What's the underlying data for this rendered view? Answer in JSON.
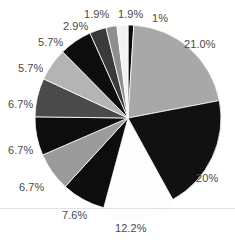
{
  "chart_data": {
    "type": "pie",
    "title": "",
    "xlabel": "",
    "ylabel": "",
    "legend": "none",
    "grid": false,
    "center": {
      "x": 128,
      "y": 118
    },
    "radius": 93,
    "start_angle_deg": -90,
    "direction": "clockwise",
    "categories": [
      "1%",
      "21.0%",
      "20%",
      "12.2%",
      "7.6%",
      "6.7%",
      "6.7%",
      "6.7%",
      "5.7%",
      "5.7%",
      "2.9%",
      "1.9%",
      "1.9%"
    ],
    "values": [
      1.0,
      21.0,
      20.0,
      12.2,
      7.6,
      6.7,
      6.7,
      6.7,
      5.7,
      5.7,
      2.9,
      1.9,
      1.9
    ],
    "labels": [
      "1%",
      "21.0%",
      "20%",
      "12.2%",
      "7.6%",
      "6.7%",
      "6.7%",
      "6.7%",
      "5.7%",
      "5.7%",
      "2.9%",
      "1.9%",
      "1.9%"
    ],
    "colors": [
      "#0a0a0a",
      "#a8a8a8",
      "#111111",
      "#fdfdfd",
      "#0d0d0d",
      "#9b9b9b",
      "#0d0d0d",
      "#4a4a4a",
      "#b4b4b4",
      "#0d0d0d",
      "#3a3a3a",
      "#8e8e8e",
      "#f2f2f2"
    ],
    "exploded": [
      "12.2%"
    ],
    "explode_offset_px": 9,
    "slice_stroke": "#ffffff",
    "background": "#ffffff",
    "label_color": "#4a4a4a"
  },
  "labels": {
    "p21": "21.0%",
    "p20": "20%",
    "p122": "12.2%",
    "p76": "7.6%",
    "p67c": "6.7%",
    "p67b": "6.7%",
    "p67a": "6.7%",
    "p57b": "5.7%",
    "p57a": "5.7%",
    "p29": "2.9%",
    "p19b": "1.9%",
    "p19a": "1.9%",
    "p1": "1%"
  }
}
